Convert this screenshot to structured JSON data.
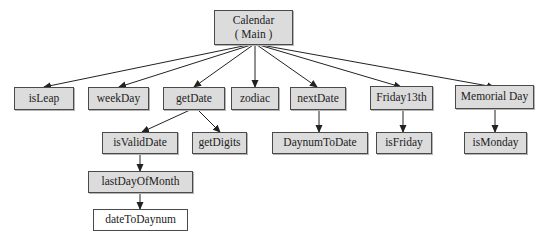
{
  "diagram": {
    "type": "call-hierarchy-tree",
    "root": {
      "line1": "Calendar",
      "line2": "( Main )"
    },
    "level1": [
      {
        "id": "isLeap",
        "label": "isLeap"
      },
      {
        "id": "weekDay",
        "label": "weekDay"
      },
      {
        "id": "getDate",
        "label": "getDate"
      },
      {
        "id": "zodiac",
        "label": "zodiac"
      },
      {
        "id": "nextDate",
        "label": "nextDate"
      },
      {
        "id": "friday13th",
        "label": "Friday13th"
      },
      {
        "id": "memorialDay",
        "label": "Memorial Day"
      }
    ],
    "level2": [
      {
        "id": "isValidDate",
        "label": "isValidDate",
        "parent": "getDate"
      },
      {
        "id": "getDigits",
        "label": "getDigits",
        "parent": "getDate"
      },
      {
        "id": "daynumToDate",
        "label": "DaynumToDate",
        "parent": "nextDate"
      },
      {
        "id": "isFriday",
        "label": "isFriday",
        "parent": "friday13th"
      },
      {
        "id": "isMonday",
        "label": "isMonday",
        "parent": "memorialDay"
      }
    ],
    "level3": [
      {
        "id": "lastDayOfMonth",
        "label": "lastDayOfMonth",
        "parent": "isValidDate"
      }
    ],
    "level4": [
      {
        "id": "dateToDaynum",
        "label": "dateToDaynum",
        "parent": "lastDayOfMonth"
      }
    ],
    "colors": {
      "node_fill": "#dcdcdc",
      "leaf_fill": "#ffffff",
      "border": "#4a4a4a",
      "edge": "#222222"
    }
  }
}
